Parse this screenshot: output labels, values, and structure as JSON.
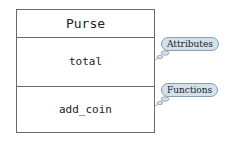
{
  "class_box": {
    "name": "Purse",
    "attributes": [
      "total"
    ],
    "functions": [
      "add_coin"
    ]
  },
  "callouts": {
    "attributes_label": "Attributes",
    "functions_label": "Functions"
  },
  "colors": {
    "callout_fill": "#d4e0ec",
    "callout_border": "#8a9cb0",
    "box_border": "#6a6a6a"
  }
}
